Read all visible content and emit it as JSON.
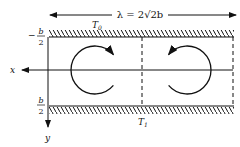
{
  "diagram": {
    "wavelength_label": "λ = 2√2b",
    "top_wall_label": "T",
    "top_wall_sub": "0",
    "bottom_wall_label": "T",
    "bottom_wall_sub": "1",
    "top_bound_sign": "−",
    "top_bound_num": "b",
    "top_bound_den": "2",
    "bottom_bound_num": "b",
    "bottom_bound_den": "2",
    "x_axis_label": "x",
    "y_axis_label": "y",
    "cells": [
      {
        "name": "left-roll",
        "rotation": "clockwise"
      },
      {
        "name": "right-roll",
        "rotation": "counterclockwise"
      }
    ],
    "line_color": "#111111"
  }
}
